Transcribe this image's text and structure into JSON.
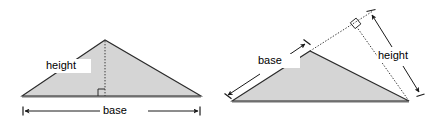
{
  "figure": {
    "colors": {
      "triangle_fill": "#d5d5d5",
      "triangle_stroke": "#2b2b2b",
      "dotted_line": "#3a3a3a",
      "dimension_line": "#1a1a1a",
      "background": "#ffffff",
      "base_shadow": "#6e6e6e"
    },
    "diagrams": [
      {
        "id": "left-triangle",
        "name": "triangle-interior-height",
        "labels": {
          "height": "height",
          "base": "base"
        },
        "geometry": {
          "vertices": [
            [
              22,
              96
            ],
            [
              105,
              40
            ],
            [
              201,
              96
            ]
          ],
          "apex": [
            105,
            40
          ],
          "height_foot": [
            105,
            96
          ],
          "base_dim_y": 111,
          "base_dim_x1": 23,
          "base_dim_x2": 200,
          "height_label_pos": [
            68,
            66
          ],
          "base_label_pos": [
            112,
            111
          ]
        },
        "markers": {
          "right_angle": true,
          "height_line_style": "dotted",
          "base_dimension_arrows": "both-ends"
        }
      },
      {
        "id": "right-triangle",
        "name": "triangle-exterior-height",
        "labels": {
          "height": "height",
          "base": "base"
        },
        "geometry": {
          "vertices": [
            [
              232,
              101
            ],
            [
              310,
              51
            ],
            [
              409,
              101
            ]
          ],
          "apex": [
            310,
            51
          ],
          "base_extension_end": [
            372,
            11
          ],
          "height_foot": [
            358,
            29
          ],
          "base_dim_from": [
            226,
            93
          ],
          "base_dim_to": [
            307,
            41
          ],
          "height_dim_from": [
            369,
            12
          ],
          "height_dim_to": [
            419,
            95
          ],
          "base_label_pos": [
            262,
            61
          ],
          "height_label_pos": [
            398,
            56
          ]
        },
        "markers": {
          "right_angle": true,
          "height_line_style": "dotted",
          "base_extension_style": "dotted",
          "base_dimension_arrows": "both-ends",
          "height_dimension_arrows": "both-ends"
        }
      }
    ]
  }
}
